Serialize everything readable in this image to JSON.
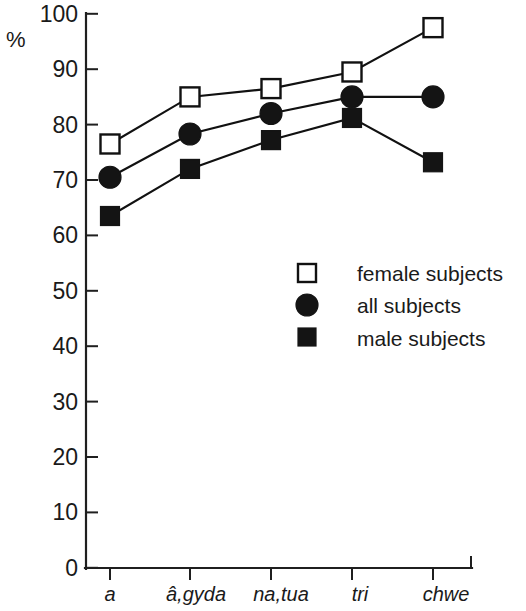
{
  "chart_data": {
    "type": "line",
    "title": "",
    "subtitle": "",
    "xlabel": "",
    "ylabel": "%",
    "ylim": [
      0,
      100
    ],
    "ytick_labels": [
      "0",
      "10",
      "20",
      "30",
      "40",
      "50",
      "60",
      "70",
      "80",
      "90",
      "100"
    ],
    "ytick_values": [
      0,
      10,
      20,
      30,
      40,
      50,
      60,
      70,
      80,
      90,
      100
    ],
    "grid": false,
    "legend_position": "center-right",
    "categories": [
      "a",
      "â,gyda",
      "na,tua",
      "tri",
      "chwe"
    ],
    "series": [
      {
        "name": "female subjects",
        "marker": "open-square",
        "values": [
          76.5,
          85.0,
          86.5,
          89.5,
          97.5
        ]
      },
      {
        "name": "all  subjects",
        "marker": "filled-circle",
        "values": [
          70.5,
          78.3,
          82.0,
          85.0,
          85.0
        ]
      },
      {
        "name": "male subjects",
        "marker": "filled-square",
        "values": [
          63.5,
          72.0,
          77.2,
          81.2,
          73.2
        ]
      }
    ],
    "colors": {
      "line": "#111111",
      "marker_fill": "#141414",
      "marker_open_fill": "#ffffff",
      "axis": "#1f1f1f",
      "text": "#1a1a1a",
      "background": "#ffffff"
    }
  },
  "legend": {
    "items": [
      {
        "label": "female subjects",
        "marker": "open-square"
      },
      {
        "label": "all  subjects",
        "marker": "filled-circle"
      },
      {
        "label": "male subjects",
        "marker": "filled-square"
      }
    ]
  },
  "axis": {
    "unit_label": "%"
  }
}
